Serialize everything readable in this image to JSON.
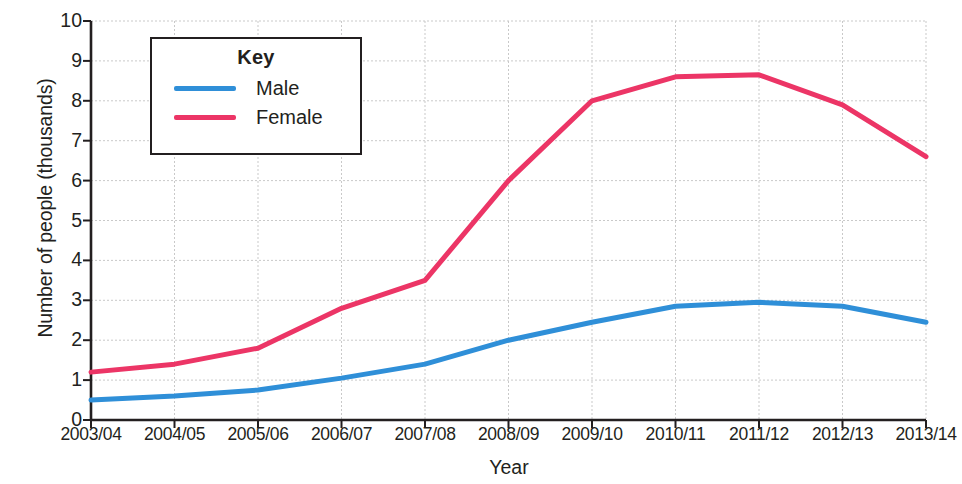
{
  "chart_data": {
    "type": "line",
    "title": "",
    "xlabel": "Year",
    "ylabel": "Number of people (thousands)",
    "categories": [
      "2003/04",
      "2004/05",
      "2005/06",
      "2006/07",
      "2007/08",
      "2008/09",
      "2009/10",
      "2010/11",
      "2011/12",
      "2012/13",
      "2013/14"
    ],
    "series": [
      {
        "name": "Male",
        "color": "#2f8fd8",
        "values": [
          0.5,
          0.6,
          0.75,
          1.05,
          1.4,
          2.0,
          2.45,
          2.85,
          2.95,
          2.85,
          2.45
        ]
      },
      {
        "name": "Female",
        "color": "#ec3566",
        "values": [
          1.2,
          1.4,
          1.8,
          2.8,
          3.5,
          6.0,
          8.0,
          8.6,
          8.65,
          7.9,
          6.6
        ]
      }
    ],
    "ylim": [
      0,
      10
    ],
    "yticks": [
      "0",
      "1",
      "2",
      "3",
      "4",
      "5",
      "6",
      "7",
      "8",
      "9",
      "10"
    ],
    "grid": true,
    "legend_position": "upper-left-inset"
  },
  "legend": {
    "title": "Key",
    "entries": [
      {
        "label": "Male",
        "color": "#2f8fd8"
      },
      {
        "label": "Female",
        "color": "#ec3566"
      }
    ]
  },
  "colors": {
    "male_line": "#2f8fd8",
    "female_line": "#ec3566",
    "axis": "#231f20",
    "grid": "#c9c9c9",
    "text": "#231f20",
    "background": "#ffffff"
  }
}
